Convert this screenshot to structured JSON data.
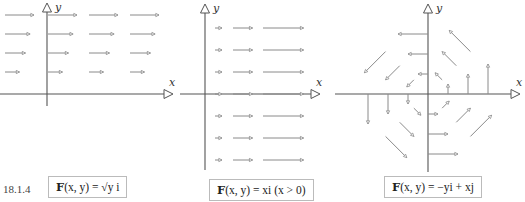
{
  "figure_number": "18.1.4",
  "axis_labels": {
    "x": "x",
    "y": "y"
  },
  "panels": [
    {
      "id": "sqrt-y-i",
      "caption": {
        "bold": "F",
        "rest": "(x, y) = √y i"
      },
      "field": "sqrt(y) i",
      "rows_y": [
        1,
        2,
        3,
        4
      ],
      "columns": 4
    },
    {
      "id": "x-i",
      "caption": {
        "bold": "F",
        "rest": "(x, y) = xi (x > 0)"
      },
      "field": "x i, x > 0",
      "rows_y": [
        -3,
        -2,
        -1,
        0,
        1,
        2,
        3
      ],
      "columns_x": [
        0.5,
        1.4,
        2.9
      ]
    },
    {
      "id": "rotation",
      "caption": {
        "bold": "F",
        "rest": "(x, y) = −yi + xj"
      },
      "field": "-y i + x j",
      "radii": [
        1,
        2,
        3
      ],
      "directions_deg": [
        0,
        45,
        90,
        135,
        180,
        225,
        270,
        315
      ],
      "arrow_scale": 0.5
    }
  ],
  "colors": {
    "axis": "#555555",
    "vector": "#8a8a8a",
    "caption_border": "#bbbbbb"
  }
}
